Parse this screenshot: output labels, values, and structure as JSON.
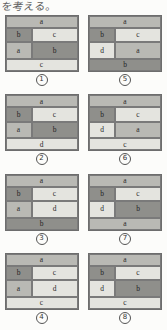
{
  "header": {
    "text": "を考える。"
  },
  "figures": [
    {
      "id": "figure-1",
      "number": "1",
      "top": {
        "label": "a",
        "shade": "mid"
      },
      "mid_left_upper": {
        "label": "b",
        "shade": "dark"
      },
      "mid_left_lower": {
        "label": "a",
        "shade": "mid"
      },
      "mid_right_upper": {
        "label": "c",
        "shade": "light"
      },
      "mid_right_lower": {
        "label": "b",
        "shade": "dark"
      },
      "bottom": {
        "label": "c",
        "shade": "light"
      }
    },
    {
      "id": "figure-5",
      "number": "5",
      "top": {
        "label": "a",
        "shade": "mid"
      },
      "mid_left_upper": {
        "label": "b",
        "shade": "dark"
      },
      "mid_left_lower": {
        "label": "d",
        "shade": "light"
      },
      "mid_right_upper": {
        "label": "c",
        "shade": "light"
      },
      "mid_right_lower": {
        "label": "a",
        "shade": "mid"
      },
      "bottom": {
        "label": "b",
        "shade": "dark"
      }
    },
    {
      "id": "figure-2",
      "number": "2",
      "top": {
        "label": "a",
        "shade": "mid"
      },
      "mid_left_upper": {
        "label": "b",
        "shade": "dark"
      },
      "mid_left_lower": {
        "label": "a",
        "shade": "mid"
      },
      "mid_right_upper": {
        "label": "c",
        "shade": "light"
      },
      "mid_right_lower": {
        "label": "b",
        "shade": "dark"
      },
      "bottom": {
        "label": "d",
        "shade": "light"
      }
    },
    {
      "id": "figure-6",
      "number": "6",
      "top": {
        "label": "a",
        "shade": "mid"
      },
      "mid_left_upper": {
        "label": "b",
        "shade": "dark"
      },
      "mid_left_lower": {
        "label": "d",
        "shade": "light"
      },
      "mid_right_upper": {
        "label": "c",
        "shade": "light"
      },
      "mid_right_lower": {
        "label": "a",
        "shade": "mid"
      },
      "bottom": {
        "label": "c",
        "shade": "light"
      }
    },
    {
      "id": "figure-3",
      "number": "3",
      "top": {
        "label": "a",
        "shade": "mid"
      },
      "mid_left_upper": {
        "label": "b",
        "shade": "dark"
      },
      "mid_left_lower": {
        "label": "a",
        "shade": "mid"
      },
      "mid_right_upper": {
        "label": "c",
        "shade": "light"
      },
      "mid_right_lower": {
        "label": "d",
        "shade": "light"
      },
      "bottom": {
        "label": "b",
        "shade": "dark"
      }
    },
    {
      "id": "figure-7",
      "number": "7",
      "top": {
        "label": "a",
        "shade": "mid"
      },
      "mid_left_upper": {
        "label": "b",
        "shade": "dark"
      },
      "mid_left_lower": {
        "label": "d",
        "shade": "light"
      },
      "mid_right_upper": {
        "label": "c",
        "shade": "light"
      },
      "mid_right_lower": {
        "label": "b",
        "shade": "dark"
      },
      "bottom": {
        "label": "a",
        "shade": "mid"
      }
    },
    {
      "id": "figure-4",
      "number": "4",
      "top": {
        "label": "a",
        "shade": "mid"
      },
      "mid_left_upper": {
        "label": "b",
        "shade": "dark"
      },
      "mid_left_lower": {
        "label": "a",
        "shade": "mid"
      },
      "mid_right_upper": {
        "label": "c",
        "shade": "light"
      },
      "mid_right_lower": {
        "label": "d",
        "shade": "light"
      },
      "bottom": {
        "label": "c",
        "shade": "light"
      }
    },
    {
      "id": "figure-8",
      "number": "8",
      "top": {
        "label": "a",
        "shade": "mid"
      },
      "mid_left_upper": {
        "label": "b",
        "shade": "dark"
      },
      "mid_left_lower": {
        "label": "d",
        "shade": "light"
      },
      "mid_right_upper": {
        "label": "c",
        "shade": "light"
      },
      "mid_right_lower": {
        "label": "b",
        "shade": "dark"
      },
      "bottom": {
        "label": "c",
        "shade": "light"
      }
    }
  ],
  "colors": {
    "shade_dark": "#8f8f8b",
    "shade_mid": "#b9b9b4",
    "shade_light": "#e4e4df",
    "outline": "#6d6d6d",
    "paper": "#fcfcfa"
  }
}
